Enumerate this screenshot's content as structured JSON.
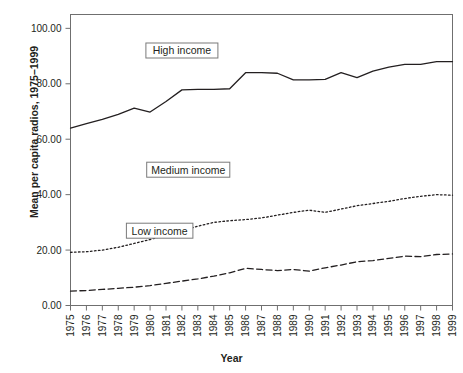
{
  "chart_data": {
    "type": "line",
    "title": "",
    "xlabel": "Year",
    "ylabel": "Mean per capita radios, 1975–1999",
    "x": [
      1975,
      1976,
      1977,
      1978,
      1979,
      1980,
      1981,
      1982,
      1983,
      1984,
      1985,
      1986,
      1987,
      1988,
      1989,
      1990,
      1991,
      1992,
      1993,
      1994,
      1995,
      1996,
      1997,
      1998,
      1999
    ],
    "xtick_labels": [
      "1975",
      "1976",
      "1977",
      "1978",
      "1979",
      "1980",
      "1981",
      "1982",
      "1983",
      "1984",
      "1985",
      "1986",
      "1987",
      "1988",
      "1989",
      "1990",
      "1991",
      "1992",
      "1993",
      "1994",
      "1995",
      "1996",
      "1997",
      "1998",
      "1999"
    ],
    "ytick_labels": [
      "0.00",
      "20.00",
      "40.00",
      "60.00",
      "80.00",
      "100.00"
    ],
    "ytick_values": [
      0,
      20,
      40,
      60,
      80,
      100
    ],
    "xlim": [
      1975,
      1999
    ],
    "ylim": [
      0,
      105
    ],
    "grid": false,
    "legend_position": "inline-annotations",
    "series": [
      {
        "name": "High income",
        "style": "solid",
        "color": "#231f20",
        "values": [
          64.0,
          65.6,
          67.2,
          69.0,
          71.2,
          69.8,
          73.6,
          77.8,
          78.0,
          78.0,
          78.2,
          84.0,
          84.0,
          83.8,
          81.4,
          81.4,
          81.6,
          84.0,
          82.2,
          84.6,
          86.0,
          87.0,
          87.0,
          88.0,
          88.0
        ]
      },
      {
        "name": "Medium income",
        "style": "dotted",
        "color": "#231f20",
        "values": [
          19.2,
          19.4,
          20.0,
          21.0,
          22.4,
          23.8,
          25.4,
          27.0,
          28.6,
          30.0,
          30.6,
          31.0,
          31.6,
          32.6,
          33.6,
          34.4,
          33.6,
          34.8,
          36.0,
          36.8,
          37.6,
          38.6,
          39.4,
          40.0,
          39.8
        ]
      },
      {
        "name": "Low income",
        "style": "dashed",
        "color": "#231f20",
        "values": [
          5.2,
          5.4,
          5.8,
          6.2,
          6.6,
          7.2,
          8.0,
          8.8,
          9.6,
          10.6,
          11.8,
          13.4,
          13.0,
          12.6,
          13.0,
          12.4,
          13.6,
          14.6,
          15.8,
          16.2,
          17.0,
          17.8,
          17.6,
          18.4,
          18.6
        ]
      }
    ],
    "annotations": [
      {
        "text": "High income",
        "x": 1982.0,
        "y": 92.0
      },
      {
        "text": "Medium income",
        "x": 1982.4,
        "y": 49.0
      },
      {
        "text": "Low income",
        "x": 1980.6,
        "y": 27.0
      }
    ]
  }
}
